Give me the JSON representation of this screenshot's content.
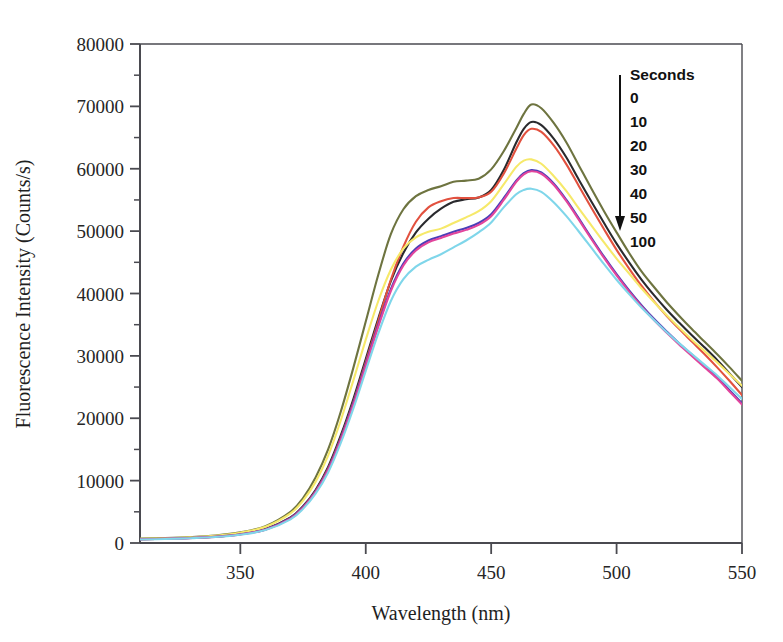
{
  "chart_data": {
    "type": "line",
    "title": "",
    "xlabel": "Wavelength (nm)",
    "ylabel": "Fluorescence Intensity (Counts/s)",
    "xlim": [
      310,
      550
    ],
    "ylim": [
      0,
      80000
    ],
    "xticks": [
      350,
      400,
      450,
      500,
      550
    ],
    "yticks": [
      0,
      10000,
      20000,
      30000,
      40000,
      50000,
      60000,
      70000,
      80000
    ],
    "xtick_labels": [
      "350",
      "400",
      "450",
      "500",
      "550"
    ],
    "ytick_labels": [
      "0",
      "10000",
      "20000",
      "30000",
      "40000",
      "50000",
      "60000",
      "70000",
      "80000"
    ],
    "grid": false,
    "minor_ticks": true,
    "legend_position": "top-right-inside",
    "legend_title": "Seconds",
    "legend_arrow": "down-arrow",
    "legend_entries": [
      "0",
      "10",
      "20",
      "30",
      "40",
      "50",
      "100"
    ],
    "x": [
      310,
      320,
      330,
      340,
      350,
      360,
      370,
      375,
      380,
      385,
      390,
      395,
      400,
      405,
      410,
      415,
      420,
      425,
      430,
      435,
      440,
      445,
      450,
      455,
      460,
      463,
      466,
      470,
      475,
      480,
      485,
      490,
      495,
      500,
      505,
      510,
      515,
      520,
      525,
      530,
      535,
      540,
      545,
      550
    ],
    "series": [
      {
        "name": "0",
        "label": "0 s",
        "color": "#6e7440",
        "values": [
          700,
          800,
          950,
          1200,
          1700,
          2700,
          5000,
          7200,
          10500,
          15000,
          21000,
          28000,
          35500,
          43000,
          49500,
          53500,
          55600,
          56600,
          57200,
          57900,
          58100,
          58400,
          59900,
          62800,
          66500,
          68800,
          70300,
          69700,
          67300,
          64200,
          60500,
          56800,
          53200,
          49800,
          46500,
          43500,
          41000,
          38600,
          36400,
          34300,
          32300,
          30300,
          28200,
          26000
        ]
      },
      {
        "name": "10",
        "label": "10 s",
        "color": "#2a2a2e",
        "values": [
          620,
          700,
          830,
          1030,
          1450,
          2250,
          4100,
          5900,
          8500,
          12200,
          17200,
          23000,
          29500,
          36000,
          42000,
          46500,
          49800,
          52000,
          53600,
          54700,
          55100,
          55400,
          56600,
          59800,
          64200,
          66400,
          67500,
          67000,
          64800,
          61800,
          58200,
          54700,
          51300,
          48000,
          45000,
          42200,
          39700,
          37400,
          35300,
          33300,
          31400,
          29400,
          27200,
          25000
        ]
      },
      {
        "name": "20",
        "label": "20 s",
        "color": "#e2513f",
        "values": [
          600,
          680,
          800,
          1000,
          1400,
          2180,
          4000,
          5750,
          8300,
          11900,
          16800,
          22500,
          29000,
          35600,
          42200,
          47500,
          51500,
          53800,
          54800,
          55300,
          55300,
          55400,
          56300,
          59200,
          63200,
          65400,
          66400,
          65900,
          63700,
          60700,
          57200,
          53700,
          50300,
          47000,
          44000,
          41200,
          38700,
          36400,
          34300,
          32300,
          30300,
          28200,
          26000,
          23700
        ]
      },
      {
        "name": "30",
        "label": "30 s",
        "color": "#f6e96a",
        "values": [
          680,
          770,
          910,
          1150,
          1650,
          2600,
          4750,
          6800,
          9800,
          14000,
          19600,
          26000,
          32600,
          38800,
          43800,
          47200,
          49000,
          49900,
          50400,
          51300,
          52200,
          53200,
          54800,
          57500,
          60300,
          61300,
          61500,
          60800,
          58800,
          56400,
          53600,
          50900,
          48200,
          45600,
          43200,
          40800,
          38600,
          36500,
          34500,
          32600,
          30800,
          29000,
          27100,
          25200
        ]
      },
      {
        "name": "40",
        "label": "40 s",
        "color": "#4a3fb8",
        "values": [
          600,
          680,
          800,
          1000,
          1400,
          2180,
          3980,
          5730,
          8250,
          11800,
          16700,
          22400,
          28700,
          35000,
          40700,
          44800,
          47200,
          48500,
          49200,
          49900,
          50500,
          51300,
          52700,
          55300,
          58100,
          59300,
          59800,
          59400,
          57600,
          55000,
          52000,
          48900,
          45900,
          43100,
          40500,
          38100,
          35900,
          33900,
          32000,
          30200,
          28400,
          26600,
          24500,
          22400
        ]
      },
      {
        "name": "50",
        "label": "50 s",
        "color": "#e2459c",
        "values": [
          590,
          665,
          785,
          980,
          1375,
          2140,
          3920,
          5650,
          8150,
          11650,
          16500,
          22100,
          28400,
          34700,
          40400,
          44500,
          46900,
          48200,
          48900,
          49600,
          50200,
          51000,
          52400,
          55000,
          57900,
          59100,
          59600,
          59200,
          57400,
          54800,
          51800,
          48700,
          45700,
          42900,
          40300,
          37900,
          35700,
          33700,
          31800,
          30000,
          28200,
          26400,
          24300,
          22200
        ]
      },
      {
        "name": "100",
        "label": "100 s",
        "color": "#7fd6ea",
        "values": [
          570,
          640,
          760,
          950,
          1330,
          2070,
          3800,
          5470,
          7900,
          11300,
          16000,
          21500,
          27600,
          33600,
          38800,
          42300,
          44300,
          45400,
          46300,
          47400,
          48500,
          49800,
          51400,
          53800,
          55900,
          56600,
          56800,
          56300,
          54600,
          52400,
          49900,
          47300,
          44700,
          42200,
          39900,
          37700,
          35700,
          33800,
          32000,
          30300,
          28600,
          26900,
          25000,
          23100
        ]
      }
    ]
  }
}
